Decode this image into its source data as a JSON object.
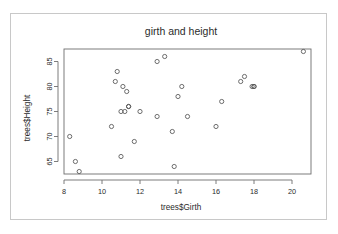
{
  "window": {
    "background_color": "#ffffff",
    "card_border_color": "#c8c8c8"
  },
  "chart_data": {
    "type": "scatter",
    "title": "girth and height",
    "xlabel": "trees$Girth",
    "ylabel": "trees$Height",
    "xlim": [
      8.0,
      21.0
    ],
    "ylim": [
      62.5,
      87.5
    ],
    "xticks": [
      8,
      10,
      12,
      14,
      16,
      18,
      20
    ],
    "xtick_labels": [
      "8",
      "10",
      "12",
      "14",
      "16",
      "18",
      "20"
    ],
    "yticks": [
      65,
      70,
      75,
      80,
      85
    ],
    "ytick_labels": [
      "65",
      "70",
      "75",
      "80",
      "85"
    ],
    "grid": false,
    "legend": false,
    "marker": "open-circle",
    "marker_color": "#555555",
    "n_points": 31,
    "x": [
      8.3,
      8.6,
      8.8,
      10.5,
      10.7,
      10.8,
      11.0,
      11.0,
      11.1,
      11.2,
      11.3,
      11.4,
      11.4,
      11.7,
      12.0,
      12.9,
      12.9,
      13.3,
      13.7,
      13.8,
      14.0,
      14.2,
      14.5,
      16.0,
      16.3,
      17.3,
      17.5,
      17.9,
      18.0,
      18.0,
      20.6
    ],
    "y": [
      70,
      65,
      63,
      72,
      81,
      83,
      66,
      75,
      80,
      75,
      79,
      76,
      76,
      69,
      75,
      74,
      85,
      86,
      71,
      64,
      78,
      80,
      74,
      72,
      77,
      81,
      82,
      80,
      80,
      80,
      87
    ],
    "points": [
      {
        "x": 8.3,
        "y": 70
      },
      {
        "x": 8.6,
        "y": 65
      },
      {
        "x": 8.8,
        "y": 63
      },
      {
        "x": 10.5,
        "y": 72
      },
      {
        "x": 10.7,
        "y": 81
      },
      {
        "x": 10.8,
        "y": 83
      },
      {
        "x": 11.0,
        "y": 66
      },
      {
        "x": 11.0,
        "y": 75
      },
      {
        "x": 11.1,
        "y": 80
      },
      {
        "x": 11.2,
        "y": 75
      },
      {
        "x": 11.3,
        "y": 79
      },
      {
        "x": 11.4,
        "y": 76
      },
      {
        "x": 11.4,
        "y": 76
      },
      {
        "x": 11.7,
        "y": 69
      },
      {
        "x": 12.0,
        "y": 75
      },
      {
        "x": 12.9,
        "y": 74
      },
      {
        "x": 12.9,
        "y": 85
      },
      {
        "x": 13.3,
        "y": 86
      },
      {
        "x": 13.7,
        "y": 71
      },
      {
        "x": 13.8,
        "y": 64
      },
      {
        "x": 14.0,
        "y": 78
      },
      {
        "x": 14.2,
        "y": 80
      },
      {
        "x": 14.5,
        "y": 74
      },
      {
        "x": 16.0,
        "y": 72
      },
      {
        "x": 16.3,
        "y": 77
      },
      {
        "x": 17.3,
        "y": 81
      },
      {
        "x": 17.5,
        "y": 82
      },
      {
        "x": 17.9,
        "y": 80
      },
      {
        "x": 18.0,
        "y": 80
      },
      {
        "x": 18.0,
        "y": 80
      },
      {
        "x": 20.6,
        "y": 87
      }
    ]
  }
}
